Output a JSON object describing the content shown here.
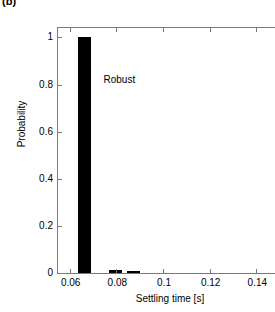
{
  "panel": {
    "label": "(b)"
  },
  "chart_data": {
    "type": "bar",
    "title": "",
    "subtitle": "",
    "xlabel": "Settling time [s]",
    "ylabel": "Probability",
    "xlim": [
      0.055,
      0.151
    ],
    "ylim": [
      0,
      1.04
    ],
    "xticks": [
      0.06,
      0.08,
      0.1,
      0.12,
      0.14
    ],
    "xtick_labels": [
      "0.06",
      "0.08",
      "0.1",
      "0.12",
      "0.14"
    ],
    "yticks": [
      0,
      0.2,
      0.4,
      0.6,
      0.8,
      1
    ],
    "ytick_labels": [
      "0",
      "0.2",
      "0.4",
      "0.6",
      "0.8",
      "1"
    ],
    "grid": false,
    "legend": null,
    "bar_color": "#000000",
    "bar_width": 0.0055,
    "x": [
      0.0665,
      0.0795,
      0.0875
    ],
    "values": [
      1.0,
      0.012,
      0.008
    ],
    "annotations": [
      {
        "text": "Robust",
        "x": 0.0745,
        "y": 0.845
      }
    ]
  }
}
